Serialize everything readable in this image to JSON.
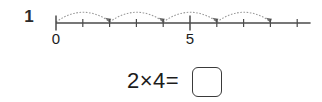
{
  "problem": {
    "number": "1"
  },
  "numberline": {
    "axis_labels": [
      {
        "text": "0",
        "value": 0
      },
      {
        "text": "5",
        "value": 5
      }
    ],
    "tick_values": [
      0,
      1,
      2,
      3,
      4,
      5,
      6,
      7,
      8,
      9
    ],
    "major_tick_values": [
      0,
      5
    ],
    "range_min": 0,
    "range_max": 9.5,
    "jumps": [
      {
        "from": 0,
        "to": 2
      },
      {
        "from": 2,
        "to": 4
      },
      {
        "from": 4,
        "to": 6
      },
      {
        "from": 6,
        "to": 8
      }
    ],
    "jump_count": 4,
    "jump_size": 2,
    "line_color": "#4a4a4a",
    "arc_color": "#9a9a9a"
  },
  "equation": {
    "text": "2×4=",
    "left_operand": "2",
    "operator": "×",
    "right_operand": "4",
    "equals": "=",
    "answer_value": "",
    "answer_placeholder": ""
  }
}
